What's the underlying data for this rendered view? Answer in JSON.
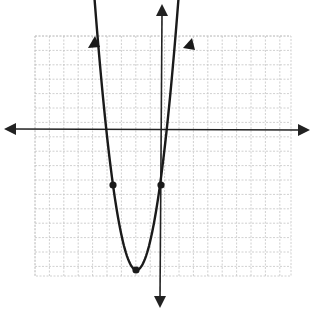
{
  "chart_data": {
    "type": "line",
    "title": "",
    "xlabel": "",
    "ylabel": "",
    "grid": true,
    "grid_range": {
      "x": [
        -9,
        9
      ],
      "y": [
        -10,
        7
      ]
    },
    "series": [
      {
        "name": "parabola",
        "function": "y = (x + 2)^2 - 8",
        "vertex": [
          -2,
          -8
        ],
        "marked_points": [
          [
            -4,
            -4
          ],
          [
            0,
            -4
          ]
        ],
        "x_intercepts": [
          -4.83,
          0.83
        ],
        "opens": "up"
      }
    ],
    "axes": {
      "x_arrows": true,
      "y_arrows": true,
      "tick_labels": []
    }
  },
  "colors": {
    "curve": "#1a1a1a",
    "grid": "#bdbdbd",
    "axis": "#222222",
    "background": "#ffffff"
  }
}
